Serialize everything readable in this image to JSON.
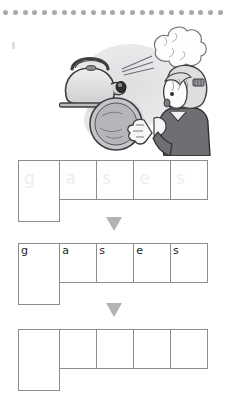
{
  "worksheet": {
    "title": "Spelling word build-up: gases",
    "dot_rule": {
      "count": 23,
      "color": "#a8a8ac",
      "name": "decorative-dotted-rule"
    },
    "illustration": {
      "name": "kettle-steam-child-illustration",
      "alt": "A whistling kettle releasing a puff of steam beside a child holding a round lid",
      "line_color": "#4a4a4a",
      "shade_color": "#c9c9cc"
    },
    "arrows": [
      {
        "name": "down-arrow-1",
        "glyph": "▼",
        "color": "#b3b3b6"
      },
      {
        "name": "down-arrow-2",
        "glyph": "▼",
        "color": "#b3b3b6"
      }
    ],
    "rows": [
      {
        "label": "traced-row",
        "style": "ghost",
        "cells": [
          {
            "letter": "g"
          },
          {
            "letter": "a"
          },
          {
            "letter": "s"
          },
          {
            "letter": "e"
          },
          {
            "letter": "s"
          }
        ]
      },
      {
        "label": "model-row",
        "style": "printed",
        "cells": [
          {
            "letter": "g"
          },
          {
            "letter": "a"
          },
          {
            "letter": "s"
          },
          {
            "letter": "e"
          },
          {
            "letter": "s"
          }
        ]
      },
      {
        "label": "blank-row",
        "style": "blank",
        "cells": [
          {
            "letter": ""
          },
          {
            "letter": ""
          },
          {
            "letter": ""
          },
          {
            "letter": ""
          },
          {
            "letter": ""
          }
        ]
      }
    ],
    "box_border_color": "#8c8c90"
  }
}
